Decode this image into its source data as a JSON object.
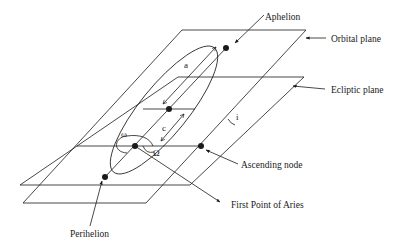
{
  "diagram": {
    "labels": {
      "aphelion": "Aphelion",
      "orbital_plane": "Orbital plane",
      "ecliptic_plane": "Ecliptic plane",
      "ascending_node": "Ascending node",
      "first_point_of_aries": "First Point of Aries",
      "perihelion": "Perihelion"
    },
    "symbols": {
      "semi_major_axis": "a",
      "focal_distance": "c",
      "argument_of_periapsis": "ω",
      "longitude_of_ascending_node": "Ω",
      "inclination": "i"
    },
    "colors": {
      "line": "#1a1a1a",
      "background": "#ffffff"
    }
  }
}
